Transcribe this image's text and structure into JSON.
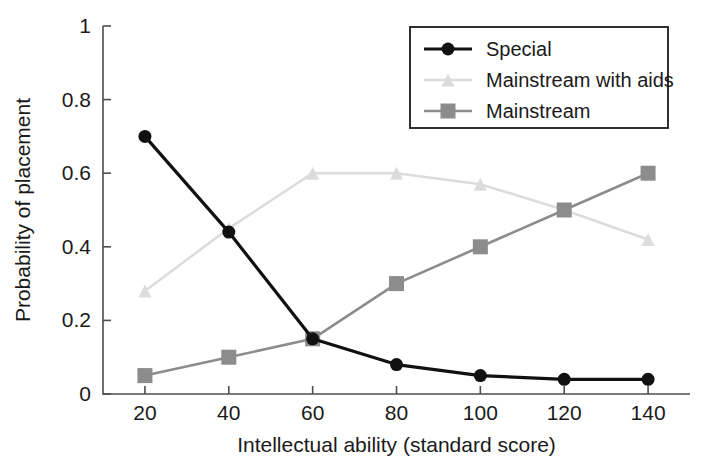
{
  "chart_data": {
    "type": "line",
    "title": "",
    "xlabel": "Intellectual ability (standard score)",
    "ylabel": "Probability of placement",
    "x": [
      20,
      40,
      60,
      80,
      100,
      120,
      140
    ],
    "xticks": [
      "20",
      "40",
      "60",
      "80",
      "100",
      "120",
      "140"
    ],
    "yticks": [
      "0",
      "0.2",
      "0.4",
      "0.6",
      "0.8",
      "1"
    ],
    "ytick_values": [
      0,
      0.2,
      0.4,
      0.6,
      0.8,
      1
    ],
    "xlim": [
      10,
      150
    ],
    "ylim": [
      0,
      1
    ],
    "grid": false,
    "legend_position": "top-right",
    "series": [
      {
        "name": "Special",
        "values": [
          0.7,
          0.44,
          0.15,
          0.08,
          0.05,
          0.04,
          0.04
        ],
        "color": "#111111",
        "marker": "circle",
        "line_width": 3.2,
        "marker_size": 13
      },
      {
        "name": "Mainstream with aids",
        "values": [
          0.28,
          0.45,
          0.6,
          0.6,
          0.57,
          0.5,
          0.42
        ],
        "color": "#dcdcdc",
        "marker": "triangle",
        "line_width": 2.6,
        "marker_size": 13
      },
      {
        "name": "Mainstream",
        "values": [
          0.05,
          0.1,
          0.15,
          0.3,
          0.4,
          0.5,
          0.6
        ],
        "color": "#8c8c8c",
        "marker": "square",
        "line_width": 2.6,
        "marker_size": 15
      }
    ]
  },
  "axes": {
    "x_title": "Intellectual ability (standard score)",
    "y_title": "Probability of placement"
  },
  "legend": {
    "items": [
      {
        "label": "Special",
        "marker": "circle",
        "color": "#111111"
      },
      {
        "label": "Mainstream with aids",
        "marker": "triangle",
        "color": "#dcdcdc"
      },
      {
        "label": "Mainstream",
        "marker": "square",
        "color": "#8c8c8c"
      }
    ]
  }
}
